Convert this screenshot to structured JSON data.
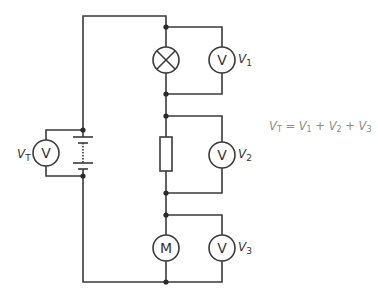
{
  "diagram": {
    "components": [
      {
        "id": "battery",
        "type": "cell-battery",
        "label": ""
      },
      {
        "id": "lamp",
        "type": "lamp",
        "label": ""
      },
      {
        "id": "resistor",
        "type": "resistor",
        "label": ""
      },
      {
        "id": "motor",
        "type": "motor",
        "symbol": "M"
      },
      {
        "id": "vt",
        "type": "voltmeter",
        "symbol": "V",
        "label": "V",
        "subscript": "T",
        "across": "battery"
      },
      {
        "id": "v1",
        "type": "voltmeter",
        "symbol": "V",
        "label": "V",
        "subscript": "1",
        "across": "lamp"
      },
      {
        "id": "v2",
        "type": "voltmeter",
        "symbol": "V",
        "label": "V",
        "subscript": "2",
        "across": "resistor"
      },
      {
        "id": "v3",
        "type": "voltmeter",
        "symbol": "V",
        "label": "V",
        "subscript": "3",
        "across": "motor"
      }
    ],
    "equation": {
      "lhs": "V",
      "lhs_sub": "T",
      "eq": " = ",
      "t1": "V",
      "t1_sub": "1",
      "plus1": " + ",
      "t2": "V",
      "t2_sub": "2",
      "plus2": " + ",
      "t3": "V",
      "t3_sub": "3"
    },
    "colors": {
      "wire": "#3a3a3a",
      "equation": "#8a8a8a"
    }
  }
}
